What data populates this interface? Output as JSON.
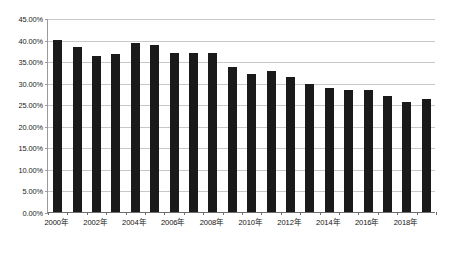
{
  "chart_data": {
    "type": "bar",
    "title": "",
    "subtitle": "",
    "xlabel": "",
    "ylabel": "",
    "ylim": [
      0,
      45
    ],
    "ytick_labels": [
      "0.00%",
      "5.00%",
      "10.00%",
      "15.00%",
      "20.00%",
      "25.00%",
      "30.00%",
      "35.00%",
      "40.00%",
      "45.00%"
    ],
    "ytick_values": [
      0,
      5,
      10,
      15,
      20,
      25,
      30,
      35,
      40,
      45
    ],
    "grid": true,
    "legend": "none",
    "categories": [
      "2000年",
      "2001年",
      "2002年",
      "2003年",
      "2004年",
      "2005年",
      "2006年",
      "2007年",
      "2008年",
      "2009年",
      "2010年",
      "2011年",
      "2012年",
      "2013年",
      "2014年",
      "2015年",
      "2016年",
      "2017年",
      "2018年",
      "2019年"
    ],
    "xtick_labels_shown": [
      "2000年",
      "2002年",
      "2004年",
      "2006年",
      "2008年",
      "2010年",
      "2012年",
      "2014年",
      "2016年",
      "2018年"
    ],
    "values": [
      40.0,
      38.3,
      36.3,
      36.7,
      39.2,
      38.7,
      37.0,
      37.0,
      37.0,
      33.6,
      32.0,
      32.6,
      31.4,
      29.6,
      28.7,
      28.4,
      28.3,
      26.8,
      25.5,
      26.3
    ],
    "series": [
      {
        "name": "",
        "color": "#1a1a1a",
        "values": [
          40.0,
          38.3,
          36.3,
          36.7,
          39.2,
          38.7,
          37.0,
          37.0,
          37.0,
          33.6,
          32.0,
          32.6,
          31.4,
          29.6,
          28.7,
          28.4,
          28.3,
          26.8,
          25.5,
          26.3
        ]
      }
    ],
    "colors": {
      "bar": "#1a1a1a",
      "grid": "#c8c8c8",
      "axis": "#6e6e6e",
      "text": "#141414",
      "background": "#ffffff"
    }
  }
}
